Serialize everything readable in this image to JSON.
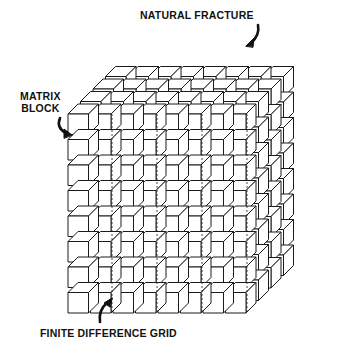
{
  "labels": {
    "natural_fracture": "NATURAL FRACTURE",
    "matrix_block_line1": "MATRIX",
    "matrix_block_line2": "BLOCK",
    "finite_difference_grid": "FINITE DIFFERENCE GRID"
  },
  "grid": {
    "columns": 8,
    "rows": 8,
    "depth_layers": 4
  },
  "colors": {
    "stroke": "#1a1a1a",
    "fill": "#ffffff"
  }
}
